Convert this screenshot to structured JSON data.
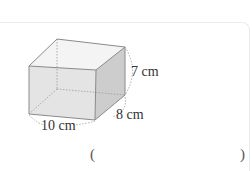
{
  "figure": {
    "type": "rectangular-prism",
    "dimensions": {
      "length": "10 cm",
      "width": "8 cm",
      "height": "7 cm"
    }
  },
  "answer": {
    "open_paren": "(",
    "close_paren": ")",
    "value": ""
  },
  "colors": {
    "edge": "#8a8a8a",
    "front_face": "#e6e6e6",
    "side_face": "#cfcfcf",
    "top_face": "#f4f4f4"
  }
}
